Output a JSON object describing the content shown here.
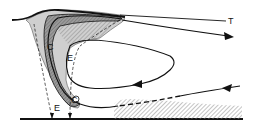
{
  "diagram": {
    "labels": {
      "tropopause": "T",
      "convergence_upper": "C",
      "convergence_lower": "C",
      "entrainment_upper": "E",
      "entrainment_lower": "E"
    },
    "colors": {
      "line": "#111111",
      "shade_dark": "#8a8a8a",
      "shade_light": "#c8c8c8",
      "hatch": "#9a9a9a",
      "background": "#ffffff"
    }
  }
}
